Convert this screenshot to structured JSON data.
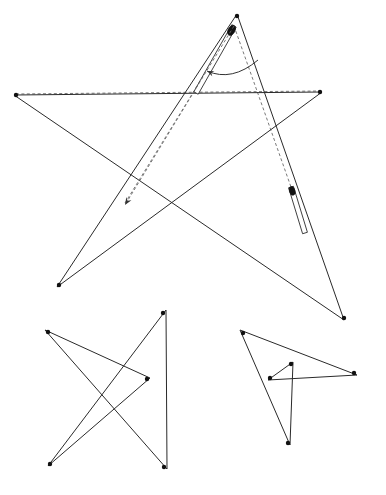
{
  "figure": {
    "canvas": {
      "width": 386,
      "height": 495,
      "background": "#ffffff"
    },
    "ink_color": "#2a2a2a",
    "dashed_color": "#6a6a6a",
    "marker_color": "#111111",
    "rod_fill": "#ffffff",
    "rod_head_color": "#121212"
  },
  "chart_data": {
    "type": "diagram-line",
    "xlabel": "",
    "ylabel": "",
    "xlim": [
      0,
      386
    ],
    "ylim": [
      0,
      495
    ],
    "grid": false,
    "legend": "none",
    "shapes": [
      {
        "name": "main-pentagram",
        "kind": "star-polygon",
        "closed": true,
        "points": [
          [
            237,
            14
          ],
          [
            344,
            320
          ],
          [
            14,
            95
          ],
          [
            322,
            92
          ],
          [
            57,
            287
          ]
        ],
        "vertex_markers": [
          [
            237,
            16
          ],
          [
            344,
            318
          ],
          [
            16,
            95
          ],
          [
            320,
            92
          ],
          [
            59,
            285
          ]
        ]
      },
      {
        "name": "lower-left-star",
        "kind": "star-polygon",
        "closed": true,
        "points": [
          [
            166,
            310
          ],
          [
            48,
            466
          ],
          [
            150,
            378
          ],
          [
            45,
            330
          ],
          [
            167,
            469
          ]
        ],
        "vertex_markers": [
          [
            163,
            313
          ],
          [
            50,
            464
          ],
          [
            147,
            379
          ],
          [
            48,
            332
          ],
          [
            164,
            467
          ]
        ]
      },
      {
        "name": "lower-right-star",
        "kind": "star-polygon",
        "closed": true,
        "points": [
          [
            240,
            330
          ],
          [
            290,
            445
          ],
          [
            293,
            362
          ],
          [
            268,
            380
          ],
          [
            357,
            375
          ]
        ],
        "vertex_markers": [
          [
            243,
            333
          ],
          [
            288,
            443
          ],
          [
            291,
            364
          ],
          [
            270,
            378
          ],
          [
            354,
            373
          ]
        ]
      }
    ],
    "guides": [
      {
        "name": "dashed-rotation-guide",
        "kind": "dashed-polyline",
        "points": [
          [
            234,
            26
          ],
          [
            125,
            203
          ]
        ]
      },
      {
        "name": "dashed-baseline-guide",
        "kind": "dashed-polyline",
        "points": [
          [
            16,
            94
          ],
          [
            320,
            91
          ]
        ]
      },
      {
        "name": "dashed-right-leg-guide",
        "kind": "dashed-polyline",
        "points": [
          [
            234,
            26
          ],
          [
            291,
            187
          ]
        ]
      }
    ],
    "annotations": [
      {
        "name": "rotation-arc-arrow",
        "kind": "curved-arrow",
        "from": [
          258,
          60
        ],
        "control": [
          232,
          82
        ],
        "to": [
          207,
          71
        ],
        "direction": "counter-clockwise"
      },
      {
        "name": "translation-arrow",
        "kind": "straight-arrow",
        "from": [
          234,
          26
        ],
        "to": [
          125,
          205
        ]
      }
    ],
    "instruments": [
      {
        "name": "upper-left-rod",
        "kind": "rod",
        "head": [
          234,
          26
        ],
        "tail": [
          196,
          93
        ],
        "head_radius": 5.5,
        "width": 5
      },
      {
        "name": "right-rod",
        "kind": "rod",
        "head": [
          291,
          187
        ],
        "tail": [
          305,
          233
        ],
        "head_radius": 4.5,
        "width": 5
      }
    ]
  }
}
